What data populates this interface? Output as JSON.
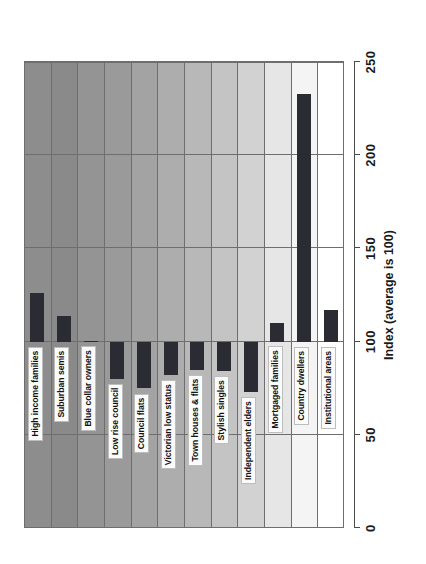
{
  "chart_data": {
    "type": "bar",
    "title": "",
    "orientation": "horizontal-rotated",
    "xlabel": "Index (average is 100)",
    "ylabel": "",
    "xlim": [
      0,
      250
    ],
    "ticks": [
      "0",
      "50",
      "100",
      "150",
      "200",
      "250"
    ],
    "tick_values": [
      0,
      50,
      100,
      150,
      200,
      250
    ],
    "baseline": 100,
    "grid": true,
    "legend": "none",
    "bar_color": "#2b2b33",
    "categories": [
      "High income families",
      "Suburban semis",
      "Blue collar owners",
      "Low rise council",
      "Council flats",
      "Victorian low status",
      "Town houses & flats",
      "Stylish singles",
      "Independent elders",
      "Mortgaged families",
      "Country dwellers",
      "Institutional areas"
    ],
    "values": [
      126,
      114,
      100,
      80,
      75,
      82,
      85,
      84,
      73,
      110,
      233,
      117
    ],
    "band_colors": [
      "#8d8d8d",
      "#8a8a8a",
      "#949494",
      "#9a9a9a",
      "#a3a3a3",
      "#adadad",
      "#b8b8b8",
      "#c4c4c4",
      "#d2d2d2",
      "#e6e6e6",
      "#f4f4f4",
      "#ffffff"
    ]
  },
  "axis": {
    "title": "Index (average is 100)"
  }
}
